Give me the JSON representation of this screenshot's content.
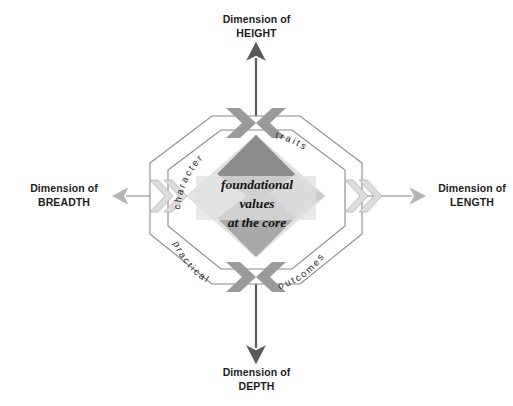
{
  "diagram": {
    "title_axes": {
      "top": {
        "line1": "Dimension of",
        "line2": "HEIGHT"
      },
      "bottom": {
        "line1": "Dimension of",
        "line2": "DEPTH"
      },
      "left": {
        "line1": "Dimension of",
        "line2": "BREADTH"
      },
      "right": {
        "line1": "Dimension of",
        "line2": "LENGTH"
      }
    },
    "core": {
      "line1": "foundational",
      "line2": "values",
      "line3": "at the core"
    },
    "ring_words": {
      "top_left": "character",
      "top_right": "traits",
      "bottom_left": "practical",
      "bottom_right": "outcomes"
    },
    "colors": {
      "quadrant_top": "#8c8c8c",
      "quadrant_left": "#e2e2e2",
      "quadrant_right": "#d2d2d2",
      "quadrant_bottom": "#a9a9a9",
      "chevron_vertical": "#9a9a9a",
      "chevron_horizontal": "#d0d0d0",
      "arrow_vertical": "#5a5a5a",
      "arrow_horizontal": "#b5b5b5",
      "octagon_stroke": "#7d7d7d",
      "text": "#1c1c1c",
      "background": "#ffffff"
    }
  }
}
